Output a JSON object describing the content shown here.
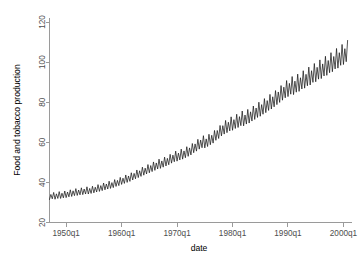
{
  "chart_data": {
    "type": "line",
    "title": "",
    "subtitle": "",
    "xlabel": "date",
    "ylabel": "Food and tobacco production",
    "xlim": [
      1947.0,
      2001.0
    ],
    "ylim": [
      20,
      122
    ],
    "grid": false,
    "legend": null,
    "xticks": [
      {
        "value": 1950,
        "label": "1950q1"
      },
      {
        "value": 1960,
        "label": "1960q1"
      },
      {
        "value": 1970,
        "label": "1970q1"
      },
      {
        "value": 1980,
        "label": "1980q1"
      },
      {
        "value": 1990,
        "label": "1990q1"
      },
      {
        "value": 2000,
        "label": "2000q1"
      }
    ],
    "yticks": [
      {
        "value": 20,
        "label": "20"
      },
      {
        "value": 40,
        "label": "40"
      },
      {
        "value": 60,
        "label": "60"
      },
      {
        "value": 80,
        "label": "80"
      },
      {
        "value": 100,
        "label": "100"
      },
      {
        "value": 120,
        "label": "120"
      }
    ],
    "series": [
      {
        "name": "Food and tobacco production",
        "color": "#1a1a1a",
        "x": [
          1947.0,
          1947.25,
          1947.5,
          1947.75,
          1948.0,
          1948.25,
          1948.5,
          1948.75,
          1949.0,
          1949.25,
          1949.5,
          1949.75,
          1950.0,
          1950.25,
          1950.5,
          1950.75,
          1951.0,
          1951.25,
          1951.5,
          1951.75,
          1952.0,
          1952.25,
          1952.5,
          1952.75,
          1953.0,
          1953.25,
          1953.5,
          1953.75,
          1954.0,
          1954.25,
          1954.5,
          1954.75,
          1955.0,
          1955.25,
          1955.5,
          1955.75,
          1956.0,
          1956.25,
          1956.5,
          1956.75,
          1957.0,
          1957.25,
          1957.5,
          1957.75,
          1958.0,
          1958.25,
          1958.5,
          1958.75,
          1959.0,
          1959.25,
          1959.5,
          1959.75,
          1960.0,
          1960.25,
          1960.5,
          1960.75,
          1961.0,
          1961.25,
          1961.5,
          1961.75,
          1962.0,
          1962.25,
          1962.5,
          1962.75,
          1963.0,
          1963.25,
          1963.5,
          1963.75,
          1964.0,
          1964.25,
          1964.5,
          1964.75,
          1965.0,
          1965.25,
          1965.5,
          1965.75,
          1966.0,
          1966.25,
          1966.5,
          1966.75,
          1967.0,
          1967.25,
          1967.5,
          1967.75,
          1968.0,
          1968.25,
          1968.5,
          1968.75,
          1969.0,
          1969.25,
          1969.5,
          1969.75,
          1970.0,
          1970.25,
          1970.5,
          1970.75,
          1971.0,
          1971.25,
          1971.5,
          1971.75,
          1972.0,
          1972.25,
          1972.5,
          1972.75,
          1973.0,
          1973.25,
          1973.5,
          1973.75,
          1974.0,
          1974.25,
          1974.5,
          1974.75,
          1975.0,
          1975.25,
          1975.5,
          1975.75,
          1976.0,
          1976.25,
          1976.5,
          1976.75,
          1977.0,
          1977.25,
          1977.5,
          1977.75,
          1978.0,
          1978.25,
          1978.5,
          1978.75,
          1979.0,
          1979.25,
          1979.5,
          1979.75,
          1980.0,
          1980.25,
          1980.5,
          1980.75,
          1981.0,
          1981.25,
          1981.5,
          1981.75,
          1982.0,
          1982.25,
          1982.5,
          1982.75,
          1983.0,
          1983.25,
          1983.5,
          1983.75,
          1984.0,
          1984.25,
          1984.5,
          1984.75,
          1985.0,
          1985.25,
          1985.5,
          1985.75,
          1986.0,
          1986.25,
          1986.5,
          1986.75,
          1987.0,
          1987.25,
          1987.5,
          1987.75,
          1988.0,
          1988.25,
          1988.5,
          1988.75,
          1989.0,
          1989.25,
          1989.5,
          1989.75,
          1990.0,
          1990.25,
          1990.5,
          1990.75,
          1991.0,
          1991.25,
          1991.5,
          1991.75,
          1992.0,
          1992.25,
          1992.5,
          1992.75,
          1993.0,
          1993.25,
          1993.5,
          1993.75,
          1994.0,
          1994.25,
          1994.5,
          1994.75,
          1995.0,
          1995.25,
          1995.5,
          1995.75,
          1996.0,
          1996.25,
          1996.5,
          1996.75,
          1997.0,
          1997.25,
          1997.5,
          1997.75,
          1998.0,
          1998.25,
          1998.5,
          1998.75,
          1999.0,
          1999.25,
          1999.5,
          1999.75,
          2000.0,
          2000.25,
          2000.5,
          2000.75
        ],
        "y": [
          31.5,
          34.0,
          31.8,
          35.0,
          31.6,
          34.3,
          32.0,
          35.4,
          32.0,
          34.6,
          32.3,
          35.7,
          32.4,
          35.2,
          32.8,
          36.3,
          33.0,
          35.8,
          33.4,
          36.9,
          33.5,
          36.2,
          33.8,
          37.3,
          33.9,
          36.7,
          34.2,
          37.8,
          34.2,
          37.0,
          34.5,
          38.1,
          34.8,
          37.6,
          35.2,
          38.9,
          35.5,
          38.4,
          35.9,
          39.7,
          36.3,
          39.2,
          36.7,
          40.6,
          37.0,
          39.9,
          37.4,
          41.4,
          38.0,
          41.0,
          38.4,
          42.5,
          39.0,
          42.1,
          39.5,
          43.7,
          40.0,
          43.2,
          40.5,
          44.8,
          41.2,
          44.5,
          41.8,
          46.2,
          42.4,
          45.8,
          43.0,
          47.6,
          43.6,
          47.1,
          44.2,
          48.9,
          44.8,
          48.4,
          45.4,
          50.2,
          46.0,
          49.7,
          46.7,
          51.6,
          47.0,
          50.7,
          47.6,
          52.6,
          48.2,
          52.0,
          48.8,
          54.0,
          49.6,
          53.6,
          50.3,
          55.6,
          50.6,
          54.6,
          51.2,
          56.6,
          51.6,
          55.7,
          52.3,
          57.8,
          53.0,
          57.2,
          53.7,
          59.4,
          54.8,
          59.2,
          55.6,
          61.5,
          56.6,
          61.1,
          57.3,
          63.3,
          57.2,
          61.7,
          57.9,
          64.0,
          58.8,
          63.5,
          59.6,
          65.9,
          61.0,
          65.9,
          61.9,
          68.4,
          63.2,
          68.3,
          64.1,
          70.9,
          64.8,
          70.0,
          65.7,
          72.7,
          66.0,
          71.3,
          66.9,
          74.0,
          67.4,
          72.8,
          68.3,
          75.6,
          68.2,
          73.6,
          69.1,
          76.4,
          69.6,
          75.2,
          70.6,
          78.1,
          71.4,
          77.1,
          72.4,
          80.0,
          73.0,
          78.8,
          74.0,
          81.8,
          74.8,
          80.8,
          75.9,
          83.9,
          76.6,
          82.7,
          77.7,
          85.8,
          78.8,
          85.1,
          79.9,
          88.3,
          81.0,
          87.5,
          82.2,
          90.8,
          82.8,
          89.4,
          84.0,
          92.8,
          83.8,
          90.5,
          85.0,
          94.0,
          85.4,
          92.2,
          86.6,
          95.7,
          87.0,
          93.9,
          88.2,
          97.5,
          88.6,
          95.7,
          89.9,
          99.3,
          90.2,
          97.4,
          91.5,
          101.1,
          91.8,
          99.1,
          93.1,
          102.9,
          93.4,
          100.8,
          94.7,
          104.7,
          95.2,
          102.8,
          96.6,
          106.8,
          97.0,
          104.7,
          98.4,
          108.8,
          98.8,
          106.7,
          100.2,
          110.8
        ]
      }
    ]
  },
  "figure": {
    "xlabel_text": "date",
    "ylabel_text": "Food and tobacco production"
  }
}
